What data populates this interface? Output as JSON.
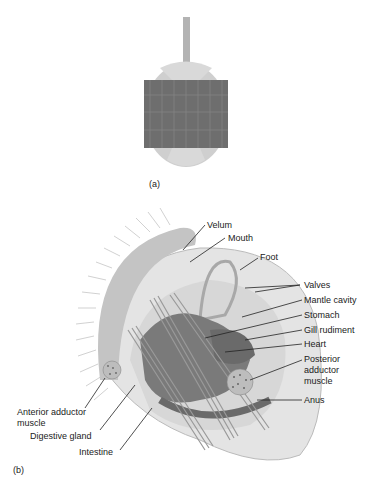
{
  "figure": {
    "panel_a": {
      "label": "(a)"
    },
    "panel_b": {
      "label": "(b)",
      "labels": [
        {
          "id": "velum",
          "text": "Velum"
        },
        {
          "id": "mouth",
          "text": "Mouth"
        },
        {
          "id": "foot",
          "text": "Foot"
        },
        {
          "id": "valves",
          "text": "Valves"
        },
        {
          "id": "mantle-cavity",
          "text": "Mantle cavity"
        },
        {
          "id": "stomach",
          "text": "Stomach"
        },
        {
          "id": "gill-rudiment",
          "text": "Gill rudiment"
        },
        {
          "id": "heart",
          "text": "Heart"
        },
        {
          "id": "posterior-adductor-1",
          "text": "Posterior"
        },
        {
          "id": "posterior-adductor-2",
          "text": "adductor"
        },
        {
          "id": "posterior-adductor-3",
          "text": "muscle"
        },
        {
          "id": "anus",
          "text": "Anus"
        },
        {
          "id": "anterior-adductor-1",
          "text": "Anterior adductor"
        },
        {
          "id": "anterior-adductor-2",
          "text": "muscle"
        },
        {
          "id": "digestive-gland",
          "text": "Digestive gland"
        },
        {
          "id": "intestine",
          "text": "Intestine"
        }
      ]
    }
  }
}
